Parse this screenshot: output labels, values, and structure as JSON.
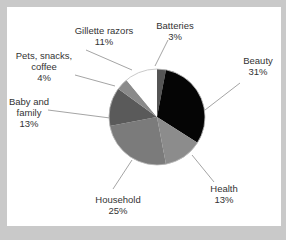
{
  "chart_data": {
    "type": "pie",
    "title": "",
    "start_angle": "top",
    "direction": "clockwise",
    "slices": [
      {
        "label": "Batteries",
        "value": 3,
        "display": "3%",
        "color": "#555555"
      },
      {
        "label": "Beauty",
        "value": 31,
        "display": "31%",
        "color": "#050505"
      },
      {
        "label": "Health",
        "value": 13,
        "display": "13%",
        "color": "#8c8c8c"
      },
      {
        "label": "Household",
        "value": 25,
        "display": "25%",
        "color": "#7b7b7b"
      },
      {
        "label": "Baby and family",
        "value": 13,
        "display": "13%",
        "color": "#5a5a5a"
      },
      {
        "label": "Pets, snacks, coffee",
        "value": 4,
        "display": "4%",
        "color": "#8a8a8a"
      },
      {
        "label": "Gillette razors",
        "value": 11,
        "display": "11%",
        "color": "#ffffff"
      }
    ],
    "legend": "none",
    "labels_with_leader_lines": true
  },
  "labels": {
    "batteries": {
      "name": "Batteries",
      "pct": "3%"
    },
    "beauty": {
      "name": "Beauty",
      "pct": "31%"
    },
    "health": {
      "name": "Health",
      "pct": "13%"
    },
    "household": {
      "name": "Household",
      "pct": "25%"
    },
    "baby_line1": "Baby and",
    "baby_line2": "family",
    "baby_pct": "13%",
    "pets_line1": "Pets, snacks,",
    "pets_line2": "coffee",
    "pets_pct": "4%",
    "gillette": {
      "name": "Gillette razors",
      "pct": "11%"
    }
  }
}
